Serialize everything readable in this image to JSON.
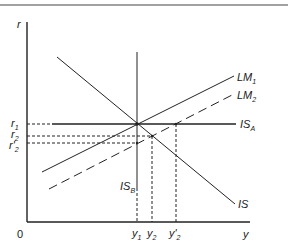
{
  "diagram": {
    "type": "IS-LM diagram",
    "colors": {
      "line": "#2a2a2a",
      "background": "#ffffff"
    },
    "axes": {
      "y_label": "r",
      "x_label": "y",
      "origin_label": "0"
    },
    "curves": {
      "lm1": {
        "label": "LM",
        "sub": "1"
      },
      "lm2": {
        "label": "LM",
        "sub": "2"
      },
      "is_a": {
        "label": "IS",
        "sub": "A"
      },
      "is_b": {
        "label": "IS",
        "sub": "B"
      },
      "is": {
        "label": "IS"
      }
    },
    "y_ticks": [
      {
        "label": "r",
        "sub": "1"
      },
      {
        "label": "r",
        "sub": "2"
      },
      {
        "label": "r'",
        "sub": "2"
      }
    ],
    "x_ticks": [
      {
        "label": "y",
        "sub": "1"
      },
      {
        "label": "y",
        "sub": "2"
      },
      {
        "label": "y'",
        "sub": "2"
      }
    ]
  }
}
